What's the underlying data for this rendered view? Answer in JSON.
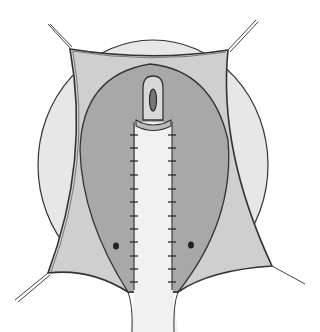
{
  "figure": {
    "type": "surgical-illustration",
    "style": "pencil and grey wash",
    "colors": {
      "background": "#ffffff",
      "outer_field": "#e6e6e6",
      "retracted_flap": "#cfcfcf",
      "inner_wound": "#a9a9a9",
      "central_strip": "#f1f1f1",
      "outline": "#333333"
    },
    "elements": [
      "outer-circular-field",
      "retracted-skin-flap",
      "retraction-sutures-4",
      "inner-oval-wound",
      "central-closed-strip",
      "stoma-opening",
      "interrupted-sutures-left",
      "interrupted-sutures-right",
      "dots-left-right"
    ],
    "suture_count_per_side": 12
  }
}
